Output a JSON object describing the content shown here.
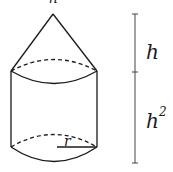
{
  "diagram": {
    "shapes": [
      {
        "type": "cone",
        "position": "top"
      },
      {
        "type": "cylinder",
        "position": "bottom"
      }
    ],
    "labels": {
      "cone_height": "h",
      "cylinder_height": "h",
      "cylinder_height_exponent": "2",
      "radius": "r",
      "top_partial": "h"
    },
    "colors": {
      "stroke": "#1a1a1a",
      "measure_line": "#444444",
      "background": "#ffffff"
    }
  }
}
